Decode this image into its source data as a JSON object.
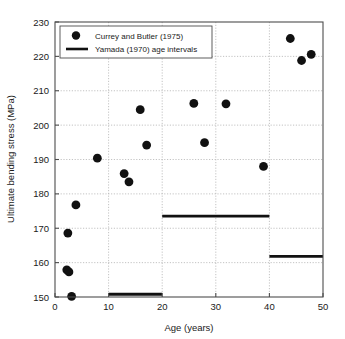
{
  "chart_data": {
    "type": "scatter",
    "title": "",
    "xlabel": "Age (years)",
    "ylabel": "Ultimate bending stress (MPa)",
    "xlim": [
      0,
      50
    ],
    "ylim": [
      150,
      230
    ],
    "xticks": [
      0,
      10,
      20,
      30,
      40,
      50
    ],
    "yticks": [
      150,
      160,
      170,
      180,
      190,
      200,
      210,
      220,
      230
    ],
    "grid": true,
    "grid_style": "dotted",
    "legend_position": "upper left",
    "series": [
      {
        "name": "Currey and Butler (1975)",
        "type": "scatter",
        "marker": "circle",
        "color": "#111111",
        "points": [
          {
            "x": 2.2,
            "y": 157.9
          },
          {
            "x": 2.6,
            "y": 157.3
          },
          {
            "x": 3.1,
            "y": 150.2
          },
          {
            "x": 2.4,
            "y": 168.6
          },
          {
            "x": 3.9,
            "y": 176.8
          },
          {
            "x": 7.9,
            "y": 190.4
          },
          {
            "x": 12.9,
            "y": 185.9
          },
          {
            "x": 13.8,
            "y": 183.5
          },
          {
            "x": 15.9,
            "y": 204.5
          },
          {
            "x": 17.1,
            "y": 194.2
          },
          {
            "x": 25.9,
            "y": 206.3
          },
          {
            "x": 27.9,
            "y": 194.9
          },
          {
            "x": 31.9,
            "y": 206.2
          },
          {
            "x": 38.9,
            "y": 188.0
          },
          {
            "x": 43.9,
            "y": 225.2
          },
          {
            "x": 46.0,
            "y": 218.8
          },
          {
            "x": 47.8,
            "y": 220.6
          }
        ]
      },
      {
        "name": "Yamada (1970) age intervals",
        "type": "step-segments",
        "color": "#111111",
        "segments": [
          {
            "x0": 10,
            "x1": 20,
            "y": 150.8
          },
          {
            "x0": 20,
            "x1": 40,
            "y": 173.5
          },
          {
            "x0": 40,
            "x1": 50,
            "y": 161.8
          }
        ]
      }
    ],
    "legend_entries": [
      {
        "label": "Currey and Butler (1975)",
        "marker": "circle"
      },
      {
        "label": "Yamada (1970) age intervals",
        "marker": "line"
      }
    ]
  },
  "axes": {
    "x_label": "Age (years)",
    "y_label": "Ultimate bending stress (MPa)",
    "x_tick_labels": [
      "0",
      "10",
      "20",
      "30",
      "40",
      "50"
    ],
    "y_tick_labels": [
      "150",
      "160",
      "170",
      "180",
      "190",
      "200",
      "210",
      "220",
      "230"
    ]
  },
  "legend": {
    "entry_scatter_label": "Currey and Butler (1975)",
    "entry_line_label": "Yamada (1970) age intervals"
  },
  "colors": {
    "marker": "#111111",
    "axis": "#4d4d4d",
    "grid": "#b4b4b4",
    "text": "#1a1a1a",
    "background": "#ffffff"
  }
}
